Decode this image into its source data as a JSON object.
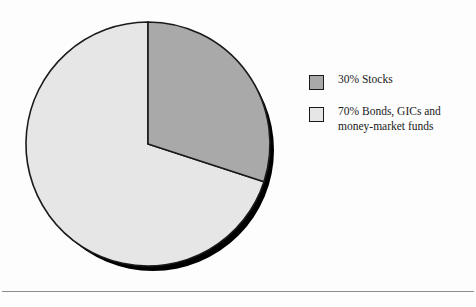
{
  "chart_data": {
    "type": "pie",
    "title": "",
    "subtitle": "",
    "xlabel": "",
    "ylabel": "",
    "grid": false,
    "legend_position": "right",
    "start_angle_deg": 90,
    "direction": "counterclockwise",
    "categories": [
      "30% Stocks",
      "70% Bonds, GICs and money-market funds"
    ],
    "values": [
      30,
      70
    ],
    "units": "percent",
    "colors": [
      "#a9a9a9",
      "#e6e6e6"
    ],
    "slices": [
      {
        "label": "30% Stocks",
        "short_label": "Stocks",
        "value": 30,
        "percent_text": "30%",
        "color": "#a9a9a9",
        "edge_color": "#1a1a1a"
      },
      {
        "label": "70% Bonds, GICs and money-market funds",
        "short_label": "Bonds, GICs and money-market funds",
        "value": 70,
        "percent_text": "70%",
        "color": "#e6e6e6",
        "edge_color": "#1a1a1a"
      }
    ],
    "shadow_color": "#000000"
  },
  "legend": {
    "items": [
      {
        "swatch_color": "#a9a9a9",
        "label": "30% Stocks"
      },
      {
        "swatch_color": "#e6e6e6",
        "label": "70% Bonds, GICs and\nmoney-market funds"
      }
    ]
  },
  "figure": {
    "background": "#fdfdfd",
    "rule_color": "#8a8a8a"
  }
}
